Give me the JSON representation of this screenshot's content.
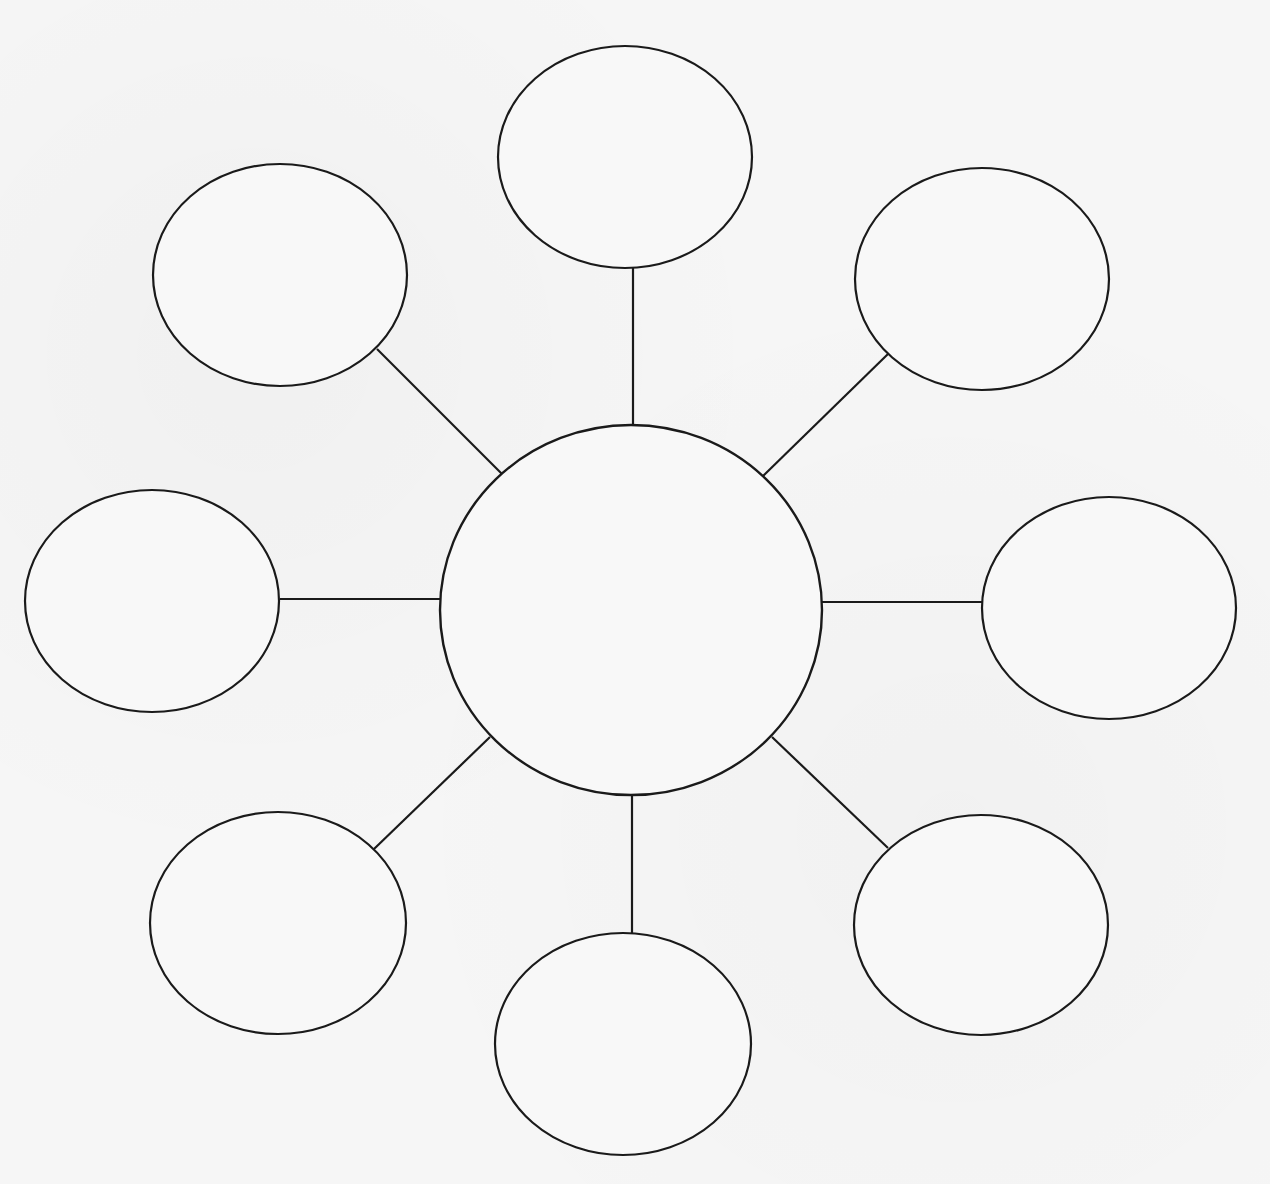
{
  "diagram": {
    "type": "bubble-map",
    "background_color": "#f6f6f6",
    "stroke_color": "#1a1a1a",
    "center": {
      "label": "",
      "cx": 631,
      "cy": 610,
      "rx": 191,
      "ry": 185
    },
    "satellites": [
      {
        "id": "top",
        "label": "",
        "cx": 625,
        "cy": 157,
        "rx": 127,
        "ry": 111,
        "line": {
          "x1": 633,
          "y1": 268,
          "x2": 633,
          "y2": 425
        }
      },
      {
        "id": "upper-right",
        "label": "",
        "cx": 982,
        "cy": 279,
        "rx": 127,
        "ry": 111,
        "line": {
          "x1": 888,
          "y1": 354,
          "x2": 763,
          "y2": 476
        }
      },
      {
        "id": "right",
        "label": "",
        "cx": 1109,
        "cy": 608,
        "rx": 127,
        "ry": 111,
        "line": {
          "x1": 822,
          "y1": 602,
          "x2": 982,
          "y2": 602
        }
      },
      {
        "id": "lower-right",
        "label": "",
        "cx": 981,
        "cy": 925,
        "rx": 127,
        "ry": 110,
        "line": {
          "x1": 772,
          "y1": 737,
          "x2": 888,
          "y2": 848
        }
      },
      {
        "id": "bottom",
        "label": "",
        "cx": 623,
        "cy": 1044,
        "rx": 128,
        "ry": 111,
        "line": {
          "x1": 632,
          "y1": 795,
          "x2": 632,
          "y2": 933
        }
      },
      {
        "id": "lower-left",
        "label": "",
        "cx": 278,
        "cy": 923,
        "rx": 128,
        "ry": 111,
        "line": {
          "x1": 374,
          "y1": 849,
          "x2": 490,
          "y2": 737
        }
      },
      {
        "id": "left",
        "label": "",
        "cx": 152,
        "cy": 601,
        "rx": 127,
        "ry": 111,
        "line": {
          "x1": 280,
          "y1": 599,
          "x2": 440,
          "y2": 599
        }
      },
      {
        "id": "upper-left",
        "label": "",
        "cx": 280,
        "cy": 275,
        "rx": 127,
        "ry": 111,
        "line": {
          "x1": 377,
          "y1": 349,
          "x2": 502,
          "y2": 474
        }
      }
    ]
  }
}
